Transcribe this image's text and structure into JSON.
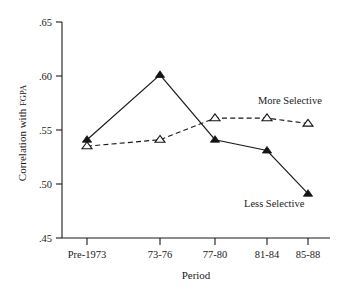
{
  "chart_data": {
    "type": "line",
    "title": "",
    "xlabel": "Period",
    "ylabel": "Correlation with FGPA",
    "categories": [
      "Pre-1973",
      "73-76",
      "77-80",
      "81-84",
      "85-88"
    ],
    "ylim": [
      0.45,
      0.65
    ],
    "yticks": [
      ".65",
      ".60",
      ".55",
      ".50",
      ".45"
    ],
    "ytick_values": [
      0.65,
      0.6,
      0.55,
      0.5,
      0.45
    ],
    "grid": false,
    "legend_position": "inline-annotations",
    "series": [
      {
        "name": "Less Selective",
        "values": [
          0.541,
          0.601,
          0.541,
          0.531,
          0.491
        ],
        "marker": "filled-triangle",
        "linestyle": "solid",
        "color": "#141414"
      },
      {
        "name": "More Selective",
        "values": [
          0.535,
          0.541,
          0.561,
          0.561,
          0.556
        ],
        "marker": "open-triangle",
        "linestyle": "dashed",
        "color": "#141414"
      }
    ],
    "annotations": [
      {
        "text": "More Selective",
        "series": "More Selective"
      },
      {
        "text": "Less Selective",
        "series": "Less Selective"
      }
    ]
  },
  "axes": {
    "y_label": "Correlation with FGPA",
    "y_label_main": "Correlation with ",
    "y_label_smallcaps": "FGPA",
    "x_label": "Period"
  },
  "ticks": {
    "y": [
      ".65",
      ".60",
      ".55",
      ".50",
      ".45"
    ],
    "x": [
      "Pre-1973",
      "73-76",
      "77-80",
      "81-84",
      "85-88"
    ]
  },
  "labels": {
    "more_selective": "More Selective",
    "less_selective": "Less Selective"
  },
  "colors": {
    "ink": "#1a1a1a",
    "marker": "#141414",
    "background": "#ffffff"
  }
}
